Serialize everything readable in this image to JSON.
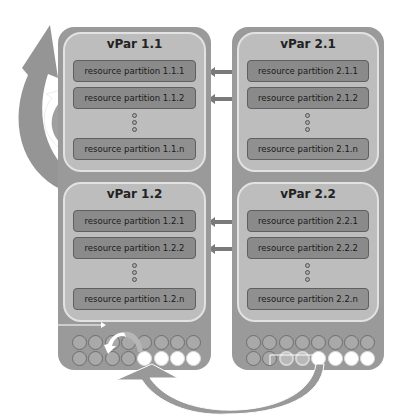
{
  "diagram": {
    "type": "vPar resource migration diagram",
    "hosts": [
      {
        "id": "host-1",
        "vpars": [
          {
            "title": "vPar 1.1",
            "partitions": [
              "resource partition 1.1.1",
              "resource partition 1.1.2",
              "resource partition 1.1.n"
            ]
          },
          {
            "title": "vPar 1.2",
            "partitions": [
              "resource partition 1.2.1",
              "resource partition 1.2.2",
              "resource partition 1.2.n"
            ]
          }
        ],
        "cpu_pool": {
          "row1": [
            "used",
            "used",
            "used",
            "used",
            "used",
            "used",
            "used",
            "used"
          ],
          "row2": [
            "used",
            "used",
            "used",
            "used",
            "free",
            "free",
            "free",
            "free"
          ]
        }
      },
      {
        "id": "host-2",
        "vpars": [
          {
            "title": "vPar 2.1",
            "partitions": [
              "resource partition 2.1.1",
              "resource partition 2.1.2",
              "resource partition 2.1.n"
            ]
          },
          {
            "title": "vPar 2.2",
            "partitions": [
              "resource partition 2.2.1",
              "resource partition 2.2.2",
              "resource partition 2.2.n"
            ]
          }
        ],
        "cpu_pool": {
          "row1": [
            "used",
            "used",
            "used",
            "used",
            "used",
            "used",
            "used",
            "used"
          ],
          "row2": [
            "used",
            "used",
            "moving",
            "moving",
            "free",
            "free",
            "free",
            "free"
          ]
        }
      }
    ],
    "connections": [
      {
        "from": "resource partition 1.1.1",
        "to": "resource partition 2.1.1",
        "style": "double-arrow"
      },
      {
        "from": "resource partition 1.1.2",
        "to": "resource partition 2.1.2",
        "style": "double-arrow"
      },
      {
        "from": "resource partition 1.2.1",
        "to": "resource partition 2.2.1",
        "style": "double-arrow"
      },
      {
        "from": "resource partition 1.2.2",
        "to": "resource partition 2.2.2",
        "style": "double-arrow"
      }
    ],
    "colors": {
      "host": "#9a9a9a",
      "vpar": "#bdbdbd",
      "partition": "#8a8a8a",
      "arrow": "#8c8c8c",
      "free_cpu": "#ffffff"
    }
  }
}
